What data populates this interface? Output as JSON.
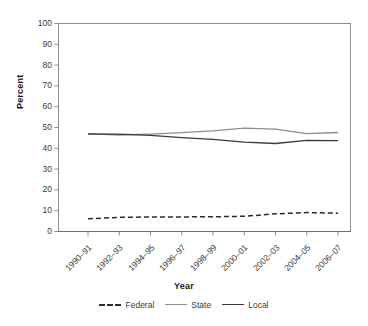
{
  "chart_data": {
    "type": "line",
    "title": "",
    "xlabel": "Year",
    "ylabel": "Percent",
    "ylim": [
      0,
      100
    ],
    "yticks": [
      0,
      10,
      20,
      30,
      40,
      50,
      60,
      70,
      80,
      90,
      100
    ],
    "categories": [
      "1990–91",
      "1992–93",
      "1994–95",
      "1996–97",
      "1998–99",
      "2000–01",
      "2002–03",
      "2004–05",
      "2006–07"
    ],
    "grid": false,
    "legend_position": "bottom",
    "series": [
      {
        "name": "Federal",
        "style": "dashed",
        "color": "#2b2b2b",
        "values": [
          6.1,
          6.8,
          7.0,
          7.0,
          7.1,
          7.3,
          8.5,
          9.1,
          8.8
        ]
      },
      {
        "name": "State",
        "style": "solid",
        "color": "#8d8d8d",
        "values": [
          47.1,
          46.4,
          46.8,
          47.5,
          48.4,
          49.7,
          49.2,
          47.1,
          47.6
        ]
      },
      {
        "name": "Local",
        "style": "solid",
        "color": "#3a3a3a",
        "values": [
          46.8,
          46.8,
          46.2,
          45.1,
          44.3,
          43.0,
          42.3,
          43.8,
          43.7
        ]
      }
    ]
  },
  "legend": {
    "items": [
      {
        "label": "Federal"
      },
      {
        "label": "State"
      },
      {
        "label": "Local"
      }
    ]
  },
  "axis": {
    "y_title": "Percent",
    "x_title": "Year"
  }
}
